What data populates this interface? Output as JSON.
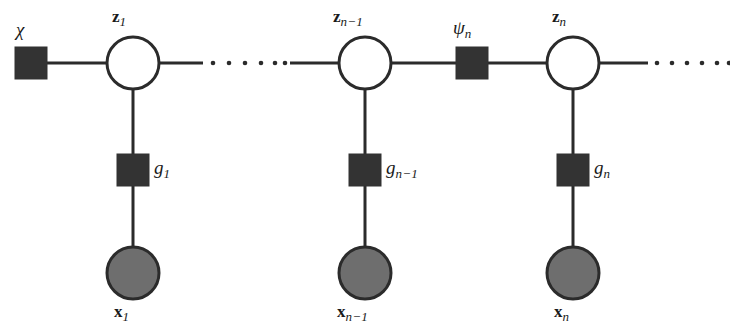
{
  "figure": {
    "type": "factor-graph",
    "title": "",
    "colors": {
      "stroke": "#2b2b2b",
      "factor_fill": "#333333",
      "observed_fill": "#6e6e6e",
      "latent_fill": "#ffffff",
      "background": "#ffffff"
    },
    "geometry": {
      "latent_radius": 26,
      "observed_radius": 26,
      "factor_size": 32,
      "edge_width": 3,
      "top_row_y": 63,
      "factor_row_y": 170,
      "bottom_row_y": 273
    }
  },
  "nodes": {
    "prior_factor": {
      "id": "chi",
      "kind": "factor",
      "label": "χ",
      "subscript": "",
      "x": 31,
      "y": 63,
      "label_x": 16,
      "label_y": 20
    },
    "latent_variables": [
      {
        "id": "z1",
        "kind": "latent-variable",
        "label": "z",
        "subscript": "1",
        "x": 133,
        "y": 63,
        "label_x": 112,
        "label_y": 8
      },
      {
        "id": "zn-1",
        "kind": "latent-variable",
        "label": "z",
        "subscript": "n−1",
        "x": 365,
        "y": 63,
        "label_x": 333,
        "label_y": 8
      },
      {
        "id": "zn",
        "kind": "latent-variable",
        "label": "z",
        "subscript": "n",
        "x": 573,
        "y": 63,
        "label_x": 552,
        "label_y": 8
      }
    ],
    "transition_factors": [
      {
        "id": "psin",
        "kind": "factor",
        "label": "ψ",
        "subscript": "n",
        "x": 472,
        "y": 63,
        "label_x": 453,
        "label_y": 18
      }
    ],
    "emission_factors": [
      {
        "id": "g1",
        "kind": "factor",
        "label": "g",
        "subscript": "1",
        "x": 133,
        "y": 170,
        "label_x": 154,
        "label_y": 158
      },
      {
        "id": "gn-1",
        "kind": "factor",
        "label": "g",
        "subscript": "n−1",
        "x": 365,
        "y": 170,
        "label_x": 386,
        "label_y": 158
      },
      {
        "id": "gn",
        "kind": "factor",
        "label": "g",
        "subscript": "n",
        "x": 573,
        "y": 170,
        "label_x": 594,
        "label_y": 158
      }
    ],
    "observed_variables": [
      {
        "id": "x1",
        "kind": "observed-variable",
        "label": "x",
        "subscript": "1",
        "x": 133,
        "y": 273,
        "label_x": 114,
        "label_y": 303
      },
      {
        "id": "xn-1",
        "kind": "observed-variable",
        "label": "x",
        "subscript": "n−1",
        "x": 365,
        "y": 273,
        "label_x": 337,
        "label_y": 303
      },
      {
        "id": "xn",
        "kind": "observed-variable",
        "label": "x",
        "subscript": "n",
        "x": 573,
        "y": 273,
        "label_x": 554,
        "label_y": 303
      }
    ]
  },
  "edges": {
    "solid": [
      {
        "id": "chi-z1",
        "x1": 47,
        "y1": 63,
        "x2": 107,
        "y2": 63
      },
      {
        "id": "z1-right",
        "x1": 159,
        "y1": 63,
        "x2": 203,
        "y2": 63
      },
      {
        "id": "left-zn-1",
        "x1": 290,
        "y1": 63,
        "x2": 339,
        "y2": 63
      },
      {
        "id": "zn-1-psin",
        "x1": 391,
        "y1": 63,
        "x2": 456,
        "y2": 63
      },
      {
        "id": "psin-zn",
        "x1": 488,
        "y1": 63,
        "x2": 547,
        "y2": 63
      },
      {
        "id": "zn-right",
        "x1": 599,
        "y1": 63,
        "x2": 648,
        "y2": 63
      },
      {
        "id": "z1-g1",
        "x1": 133,
        "y1": 89,
        "x2": 133,
        "y2": 247
      },
      {
        "id": "zn-1-gn-1",
        "x1": 365,
        "y1": 89,
        "x2": 365,
        "y2": 247
      },
      {
        "id": "zn-gn",
        "x1": 573,
        "y1": 89,
        "x2": 573,
        "y2": 247
      }
    ],
    "dotted": [
      {
        "id": "ellipsis-middle",
        "y": 63,
        "dots": [
          213,
          229,
          245,
          261,
          275,
          285
        ]
      },
      {
        "id": "ellipsis-right",
        "y": 63,
        "dots": [
          657,
          672,
          687,
          702,
          717,
          729
        ]
      }
    ]
  },
  "legend": {
    "latent_meaning": "latent state variable",
    "observed_meaning": "observed variable",
    "factor_meaning": "factor node"
  }
}
